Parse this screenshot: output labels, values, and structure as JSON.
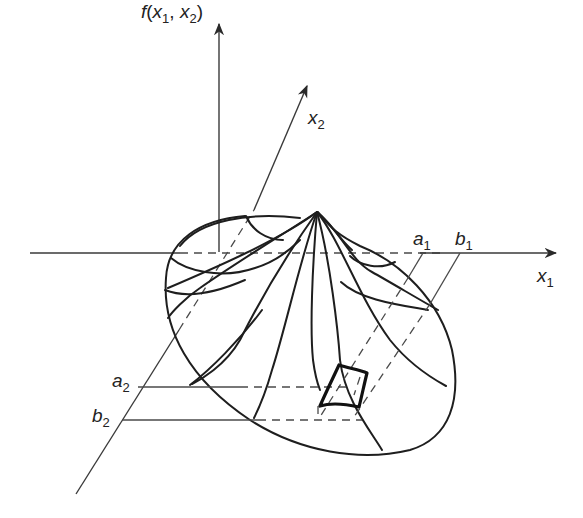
{
  "figure": {
    "type": "3d-surface-diagram",
    "colors": {
      "line": "#1e1e1e",
      "axis": "#3a3a3a",
      "background": "#ffffff"
    }
  },
  "labels": {
    "vertical_axis": {
      "func": "f",
      "open": "(",
      "var1": "x",
      "sub1": "1",
      "comma": ", ",
      "var2": "x",
      "sub2": "2",
      "close": ")"
    },
    "x2_axis": {
      "var": "x",
      "sub": "2"
    },
    "x1_axis": {
      "var": "x",
      "sub": "1"
    },
    "a1": {
      "var": "a",
      "sub": "1"
    },
    "b1": {
      "var": "b",
      "sub": "1"
    },
    "a2": {
      "var": "a",
      "sub": "2"
    },
    "b2": {
      "var": "b",
      "sub": "2"
    }
  }
}
